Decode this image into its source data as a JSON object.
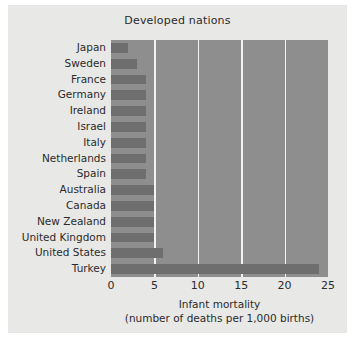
{
  "chart_data": {
    "type": "bar",
    "orientation": "horizontal",
    "title": "Developed nations",
    "xlabel_line1": "Infant mortality",
    "xlabel_line2": "(number of deaths per 1,000 births)",
    "ylabel": "",
    "categories": [
      "Japan",
      "Sweden",
      "France",
      "Germany",
      "Ireland",
      "Israel",
      "Italy",
      "Netherlands",
      "Spain",
      "Australia",
      "Canada",
      "New Zealand",
      "United Kingdom",
      "United States",
      "Turkey"
    ],
    "values": [
      2,
      3,
      4,
      4,
      4,
      4,
      4,
      4,
      4,
      5,
      5,
      5,
      5,
      6,
      24
    ],
    "xlim": [
      0,
      25
    ],
    "xticks": [
      0,
      5,
      10,
      15,
      20,
      25
    ],
    "gridlines": [
      5,
      10,
      15,
      20
    ],
    "grid": true,
    "legend": null,
    "colors": {
      "bar": "#6e6e6e",
      "plot_background": "#8e8e8e",
      "figure_background": "#e8e8e6",
      "gridline": "#f2f2f0",
      "text": "#2b2b2b"
    }
  }
}
